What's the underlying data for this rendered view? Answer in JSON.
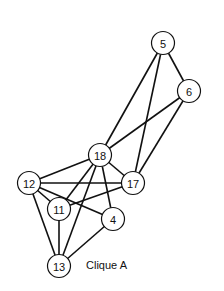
{
  "caption": "Clique A",
  "nodes": [
    {
      "id": "5",
      "x": 163,
      "y": 43
    },
    {
      "id": "6",
      "x": 189,
      "y": 91
    },
    {
      "id": "18",
      "x": 100,
      "y": 155
    },
    {
      "id": "17",
      "x": 133,
      "y": 183
    },
    {
      "id": "12",
      "x": 29,
      "y": 183
    },
    {
      "id": "11",
      "x": 59,
      "y": 209
    },
    {
      "id": "4",
      "x": 113,
      "y": 219
    },
    {
      "id": "13",
      "x": 59,
      "y": 266
    }
  ],
  "edges": [
    [
      "5",
      "6"
    ],
    [
      "5",
      "18"
    ],
    [
      "5",
      "17"
    ],
    [
      "6",
      "18"
    ],
    [
      "6",
      "17"
    ],
    [
      "18",
      "12"
    ],
    [
      "18",
      "17"
    ],
    [
      "18",
      "11"
    ],
    [
      "18",
      "13"
    ],
    [
      "18",
      "4"
    ],
    [
      "12",
      "17"
    ],
    [
      "12",
      "11"
    ],
    [
      "12",
      "4"
    ],
    [
      "12",
      "13"
    ],
    [
      "17",
      "11"
    ],
    [
      "11",
      "13"
    ],
    [
      "4",
      "13"
    ]
  ]
}
